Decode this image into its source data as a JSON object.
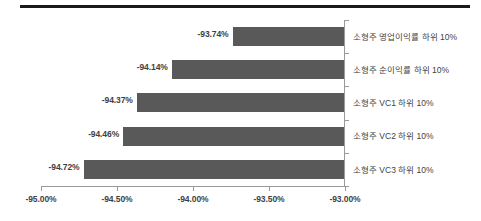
{
  "chart_data": {
    "type": "bar",
    "orientation": "horizontal",
    "title": "",
    "subtitle": "",
    "xlabel": "",
    "ylabel": "",
    "grid": false,
    "legend": false,
    "legend_position": "none",
    "xlim": [
      -95.0,
      -93.0
    ],
    "x_tick_labels": [
      "-95.00%",
      "-94.50%",
      "-94.00%",
      "-93.50%",
      "-93.00%"
    ],
    "x_ticks": [
      -95.0,
      -94.5,
      -94.0,
      -93.5,
      -93.0
    ],
    "categories": [
      "소형주 영업이익률 하위 10%",
      "소형주 순이익률 하위 10%",
      "소형주 VC1 하위 10%",
      "소형주 VC2 하위 10%",
      "소형주 VC3 하위 10%"
    ],
    "values": [
      -93.74,
      -94.14,
      -94.37,
      -94.46,
      -94.72
    ],
    "data_labels": [
      "-93.74%",
      "-94.14%",
      "-94.37%",
      "-94.46%",
      "-94.72%"
    ],
    "bar_color": "#595959",
    "axis_color": "#9a9a9a",
    "text_color": "#3f3f3f",
    "background": "#ffffff",
    "rule_color": "#1a1a1a"
  },
  "bars": [
    {
      "category": "소형주 영업이익률 하위 10%",
      "value": -93.74,
      "label": "-93.74%"
    },
    {
      "category": "소형주 순이익률 하위 10%",
      "value": -94.14,
      "label": "-94.14%"
    },
    {
      "category": "소형주 VC1 하위 10%",
      "value": -94.37,
      "label": "-94.37%"
    },
    {
      "category": "소형주 VC2 하위 10%",
      "value": -94.46,
      "label": "-94.46%"
    },
    {
      "category": "소형주 VC3 하위 10%",
      "value": -94.72,
      "label": "-94.72%"
    }
  ],
  "axis": {
    "ticks": [
      {
        "label": "-95.00%",
        "value": -95.0
      },
      {
        "label": "-94.50%",
        "value": -94.5
      },
      {
        "label": "-94.00%",
        "value": -94.0
      },
      {
        "label": "-93.50%",
        "value": -93.5
      },
      {
        "label": "-93.00%",
        "value": -93.0
      }
    ]
  }
}
